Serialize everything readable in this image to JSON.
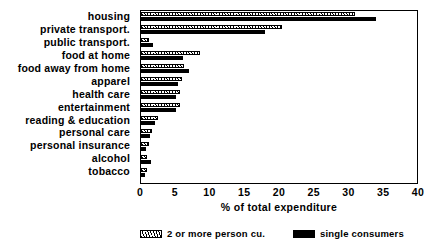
{
  "chart_data": {
    "type": "bar",
    "orientation": "horizontal",
    "title": "",
    "xlabel": "% of total expenditure",
    "ylabel": "",
    "xlim": [
      0,
      40
    ],
    "xticks": [
      0,
      5,
      10,
      15,
      20,
      25,
      30,
      35,
      40
    ],
    "grid": false,
    "legend_position": "bottom",
    "categories": [
      "housing",
      "private transport.",
      "public transport.",
      "food at home",
      "food away from home",
      "apparel",
      "health care",
      "entertainment",
      "reading & education",
      "personal care",
      "personal insurance",
      "alcohol",
      "tobacco"
    ],
    "series": [
      {
        "name": "2 or more person cu.",
        "style": "hatched",
        "color": "#000000",
        "values": [
          31.0,
          20.5,
          1.2,
          8.5,
          6.3,
          5.9,
          5.6,
          5.7,
          2.4,
          1.6,
          1.1,
          0.9,
          0.8
        ]
      },
      {
        "name": "single consumers",
        "style": "solid",
        "color": "#000000",
        "values": [
          34.0,
          18.0,
          1.7,
          6.1,
          7.0,
          5.3,
          5.0,
          5.1,
          2.1,
          1.3,
          0.7,
          1.5,
          0.6
        ]
      }
    ]
  },
  "legend": {
    "items": [
      {
        "label": "2 or more person cu.",
        "style": "hatched"
      },
      {
        "label": "single consumers",
        "style": "solid"
      }
    ]
  }
}
